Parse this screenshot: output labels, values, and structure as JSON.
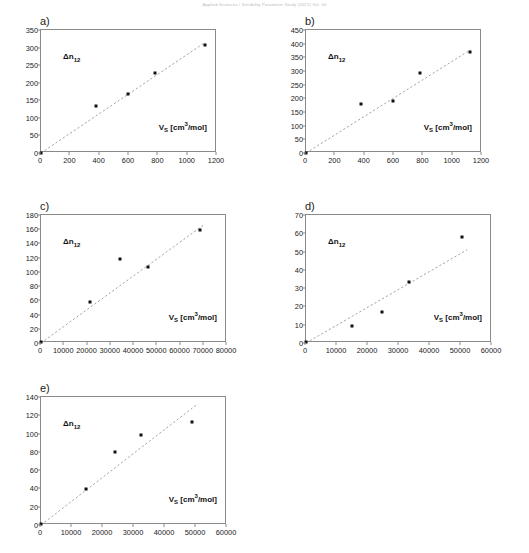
{
  "header": {
    "running_text": "Applied Sciences / Solubility Parameter Study (2021) Vol. 00"
  },
  "axis_labels": {
    "y_annotation_html": "&Delta;n<sub>12</sub>",
    "x_label_html": "V<sub>S</sub> [cm<sup>3</sup>/mol]"
  },
  "style": {
    "marker_color": "#111111",
    "line_color": "#9a9a9a",
    "frame_color": "#8a8a8a"
  },
  "chart_data": [
    {
      "id": "a",
      "type": "scatter",
      "title": "a)",
      "xlabel": "V_S [cm3/mol]",
      "ylabel": "Δn_12",
      "xlim": [
        0,
        1200
      ],
      "ylim": [
        0,
        350
      ],
      "xticks": [
        0,
        200,
        400,
        600,
        800,
        1000,
        1200
      ],
      "yticks": [
        0,
        50,
        100,
        150,
        200,
        250,
        300,
        350
      ],
      "grid": false,
      "legend": "none",
      "x": [
        0,
        375,
        595,
        775,
        1115
      ],
      "y": [
        0,
        135,
        168,
        229,
        307
      ],
      "trendline": {
        "type": "linear-through-origin",
        "x": [
          0,
          1120
        ],
        "y": [
          0,
          315
        ]
      }
    },
    {
      "id": "b",
      "type": "scatter",
      "title": "b)",
      "xlabel": "V_S [cm3/mol]",
      "ylabel": "Δn_12",
      "xlim": [
        0,
        1200
      ],
      "ylim": [
        0,
        450
      ],
      "xticks": [
        0,
        200,
        400,
        600,
        800,
        1000,
        1200
      ],
      "yticks": [
        0,
        50,
        100,
        150,
        200,
        250,
        300,
        350,
        400,
        450
      ],
      "grid": false,
      "legend": "none",
      "x": [
        0,
        375,
        590,
        775,
        1115
      ],
      "y": [
        0,
        181,
        192,
        294,
        370
      ],
      "trendline": {
        "type": "linear-through-origin",
        "x": [
          0,
          1120
        ],
        "y": [
          0,
          377
        ]
      }
    },
    {
      "id": "c",
      "type": "scatter",
      "title": "c)",
      "xlabel": "V_S [cm3/mol]",
      "ylabel": "Δn_12",
      "xlim": [
        0,
        80000
      ],
      "ylim": [
        0,
        180
      ],
      "xticks": [
        0,
        10000,
        20000,
        30000,
        40000,
        50000,
        60000,
        70000,
        80000
      ],
      "yticks": [
        0,
        20,
        40,
        60,
        80,
        100,
        120,
        140,
        160,
        180
      ],
      "grid": false,
      "legend": "none",
      "x": [
        0,
        21000,
        34000,
        46000,
        68500
      ],
      "y": [
        1,
        58,
        118,
        107,
        159
      ],
      "trendline": {
        "type": "linear-through-origin",
        "x": [
          0,
          70000
        ],
        "y": [
          0,
          166
        ]
      }
    },
    {
      "id": "d",
      "type": "scatter",
      "title": "d)",
      "xlabel": "V_S [cm3/mol]",
      "ylabel": "Δn_12",
      "xlim": [
        0,
        60000
      ],
      "ylim": [
        0,
        70
      ],
      "xticks": [
        0,
        10000,
        20000,
        30000,
        40000,
        50000,
        60000
      ],
      "yticks": [
        0,
        10,
        20,
        30,
        40,
        50,
        60,
        70
      ],
      "grid": false,
      "legend": "none",
      "x": [
        0,
        14800,
        24500,
        33300,
        50300
      ],
      "y": [
        0.5,
        9.3,
        17,
        33.5,
        58
      ],
      "trendline": {
        "type": "linear-through-origin",
        "x": [
          0,
          52000
        ],
        "y": [
          0,
          51
        ]
      }
    },
    {
      "id": "e",
      "type": "scatter",
      "title": "e)",
      "xlabel": "V_S [cm3/mol]",
      "ylabel": "Δn_12",
      "xlim": [
        0,
        60000
      ],
      "ylim": [
        0,
        140
      ],
      "xticks": [
        0,
        10000,
        20000,
        30000,
        40000,
        50000,
        60000
      ],
      "yticks": [
        0,
        20,
        40,
        60,
        80,
        100,
        120,
        140
      ],
      "grid": false,
      "legend": "none",
      "x": [
        0,
        14500,
        23800,
        32200,
        48800
      ],
      "y": [
        1,
        39.5,
        80,
        98,
        113
      ],
      "trendline": {
        "type": "linear-through-origin",
        "x": [
          0,
          50000
        ],
        "y": [
          0,
          131
        ]
      }
    }
  ]
}
